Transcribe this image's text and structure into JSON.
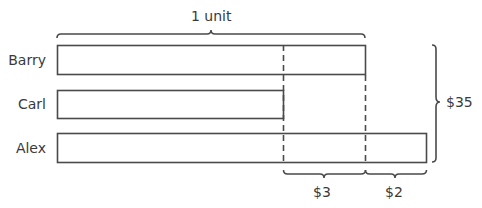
{
  "diagram": {
    "type": "bar-model",
    "top_label": "1 unit",
    "bars": [
      {
        "name": "Barry",
        "length": "1 unit"
      },
      {
        "name": "Carl",
        "length": "1 unit - $3"
      },
      {
        "name": "Alex",
        "length": "1 unit + $2"
      }
    ],
    "total_label": "$35",
    "segments": [
      {
        "label": "$3"
      },
      {
        "label": "$2"
      }
    ],
    "colors": {
      "stroke": "#4a4a4a",
      "text": "#3a3a3a",
      "background": "#ffffff"
    }
  }
}
